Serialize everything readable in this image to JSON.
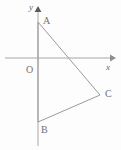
{
  "figure": {
    "background_color": "#fdfdfd",
    "line_color": "#9a9a9a",
    "axis_color": "#a8a8a8",
    "label_color": "#707070",
    "width": 121,
    "height": 150
  },
  "axes": {
    "origin_label": "O",
    "x_label": "x",
    "y_label": "y",
    "origin_px": {
      "x": 38,
      "y": 58
    },
    "x_axis": {
      "x_start": 5,
      "x_end": 112,
      "y": 58,
      "arrow": "right"
    },
    "y_axis": {
      "y_start": 8,
      "y_end": 146,
      "x": 38,
      "arrow": "up"
    }
  },
  "points": [
    {
      "name": "A",
      "label": "A",
      "px": {
        "x": 38,
        "y": 22
      },
      "label_px": {
        "x": 43,
        "y": 19
      },
      "on_axis": "y"
    },
    {
      "name": "B",
      "label": "B",
      "px": {
        "x": 38,
        "y": 122
      },
      "label_px": {
        "x": 41,
        "y": 126
      },
      "on_axis": "y"
    },
    {
      "name": "C",
      "label": "C",
      "px": {
        "x": 100,
        "y": 95
      },
      "label_px": {
        "x": 105,
        "y": 91
      },
      "on_axis": "none"
    }
  ],
  "shape": {
    "type": "triangle",
    "vertices": [
      "A",
      "B",
      "C"
    ],
    "edges": [
      {
        "from": "A",
        "to": "C"
      },
      {
        "from": "C",
        "to": "B"
      },
      {
        "from": "B",
        "to": "A"
      }
    ]
  }
}
